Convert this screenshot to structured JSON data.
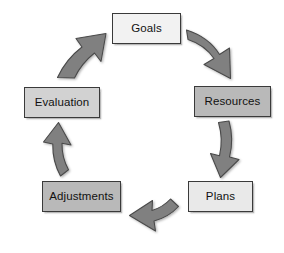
{
  "diagram": {
    "type": "cycle",
    "direction": "clockwise",
    "background_color": "#ffffff",
    "arrow_fill": "#808080",
    "arrow_stroke": "#4a4a4a",
    "nodes": [
      {
        "id": "goals",
        "label": "Goals",
        "position": "top",
        "fill": "#f2f2f2",
        "border": "#3a3a3a"
      },
      {
        "id": "resources",
        "label": "Resources",
        "position": "right",
        "fill": "#b9b9b9",
        "border": "#3a3a3a"
      },
      {
        "id": "plans",
        "label": "Plans",
        "position": "bottom-right",
        "fill": "#e9e9e9",
        "border": "#3a3a3a"
      },
      {
        "id": "adjustments",
        "label": "Adjustments",
        "position": "bottom-left",
        "fill": "#b9b9b9",
        "border": "#3a3a3a"
      },
      {
        "id": "evaluation",
        "label": "Evaluation",
        "position": "left",
        "fill": "#d2d2d2",
        "border": "#3a3a3a"
      }
    ],
    "arrows": [
      {
        "id": "goals-to-resources",
        "from": "Goals",
        "to": "Resources",
        "icon": "curved-block-arrow-down-right"
      },
      {
        "id": "resources-to-plans",
        "from": "Resources",
        "to": "Plans",
        "icon": "curved-block-arrow-down"
      },
      {
        "id": "plans-to-adjustments",
        "from": "Plans",
        "to": "Adjustments",
        "icon": "curved-block-arrow-left"
      },
      {
        "id": "adjustments-to-evaluation",
        "from": "Adjustments",
        "to": "Evaluation",
        "icon": "curved-block-arrow-up"
      },
      {
        "id": "evaluation-to-goals",
        "from": "Evaluation",
        "to": "Goals",
        "icon": "curved-block-arrow-up-right"
      }
    ]
  }
}
